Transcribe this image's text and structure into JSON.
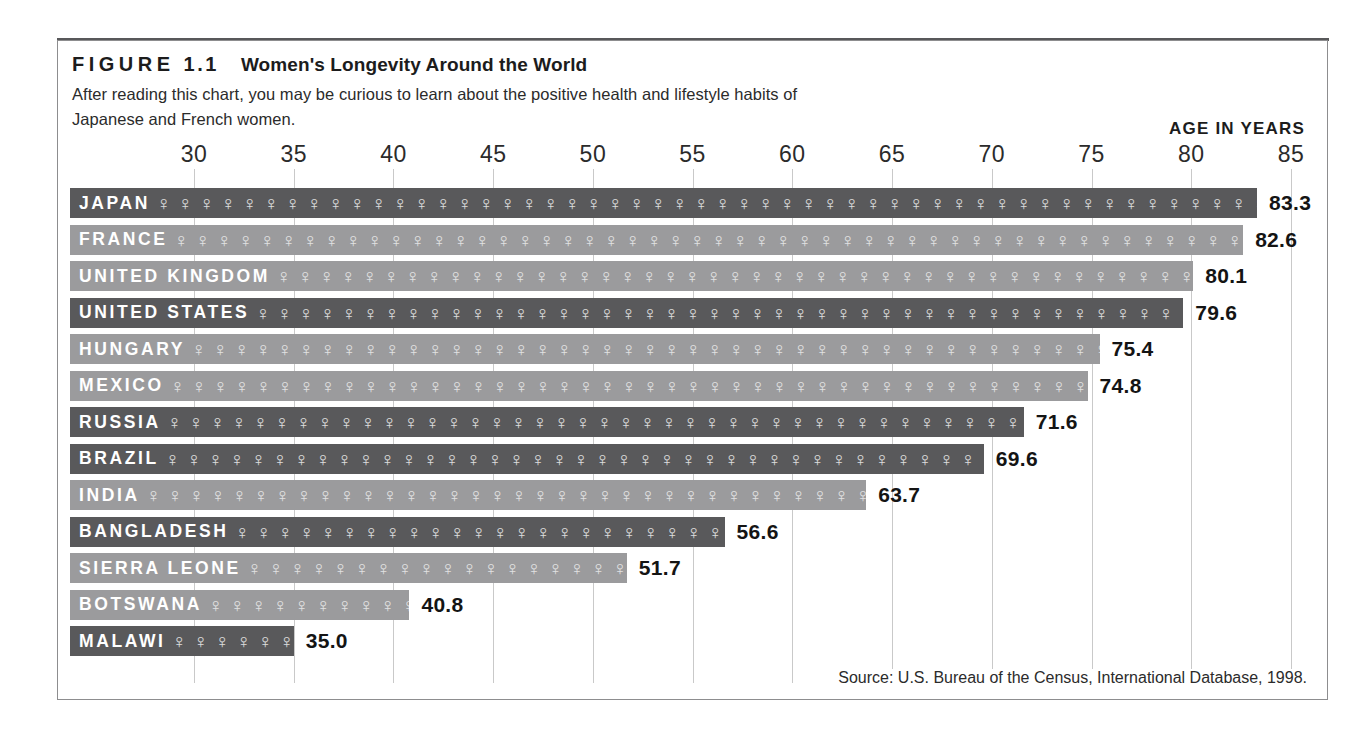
{
  "figure": {
    "kicker": "FIGURE",
    "number": "1.1",
    "title": "Women's Longevity Around the World",
    "caption_line_1": "After reading this chart, you may be curious to learn about the positive health and lifestyle habits of",
    "caption_line_2": "Japanese and French women.",
    "axis_header": "AGE IN YEARS",
    "source": "Source: U.S. Bureau of the Census, International Database, 1998.",
    "female_glyph": "♀",
    "colors": {
      "bar_dark": "#59595b",
      "bar_light": "#9b9b9d",
      "gridline": "#c9c9c9",
      "frame": "#8d8d8f",
      "rule": "#58585a",
      "text": "#1c1c1c",
      "bar_label": "#ffffff"
    }
  },
  "chart_data": {
    "type": "bar",
    "orientation": "horizontal",
    "title": "Women's Longevity Around the World",
    "subtitle": "After reading this chart, you may be curious to learn about the positive health and lifestyle habits of Japanese and French women.",
    "xlabel": "AGE IN YEARS",
    "ylabel": "",
    "xlim": [
      28,
      85.5
    ],
    "xticks": [
      30,
      35,
      40,
      45,
      50,
      55,
      60,
      65,
      70,
      75,
      80,
      85
    ],
    "grid": true,
    "legend": false,
    "source": "Source: U.S. Bureau of the Census, International Database, 1998.",
    "categories": [
      "JAPAN",
      "FRANCE",
      "UNITED KINGDOM",
      "UNITED STATES",
      "HUNGARY",
      "MEXICO",
      "RUSSIA",
      "BRAZIL",
      "INDIA",
      "BANGLADESH",
      "SIERRA LEONE",
      "BOTSWANA",
      "MALAWI"
    ],
    "values": [
      83.3,
      82.6,
      80.1,
      79.6,
      75.4,
      74.8,
      71.6,
      69.6,
      63.7,
      56.6,
      51.7,
      40.8,
      35.0
    ],
    "value_labels": [
      "83.3",
      "82.6",
      "80.1",
      "79.6",
      "75.4",
      "74.8",
      "71.6",
      "69.6",
      "63.7",
      "56.6",
      "51.7",
      "40.8",
      "35.0"
    ],
    "bar_shades": [
      "dark",
      "light",
      "light",
      "dark",
      "light",
      "light",
      "dark",
      "dark",
      "light",
      "dark",
      "light",
      "light",
      "dark"
    ]
  }
}
